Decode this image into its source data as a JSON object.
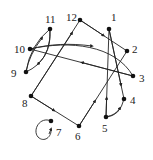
{
  "diagram": {
    "type": "directed-graph",
    "nodes": [
      {
        "id": "1",
        "label": "1",
        "x": 109,
        "y": 29,
        "lx": 112,
        "ly": 20
      },
      {
        "id": "2",
        "label": "2",
        "x": 127,
        "y": 51,
        "lx": 133,
        "ly": 51
      },
      {
        "id": "3",
        "label": "3",
        "x": 133,
        "y": 76,
        "lx": 139,
        "ly": 80
      },
      {
        "id": "4",
        "label": "4",
        "x": 124,
        "y": 99,
        "lx": 130,
        "ly": 104
      },
      {
        "id": "5",
        "label": "5",
        "x": 106,
        "y": 117,
        "lx": 102,
        "ly": 132
      },
      {
        "id": "6",
        "label": "6",
        "x": 79,
        "y": 126,
        "lx": 75,
        "ly": 140
      },
      {
        "id": "7",
        "label": "7",
        "x": 51,
        "y": 121,
        "lx": 56,
        "ly": 135
      },
      {
        "id": "8",
        "label": "8",
        "x": 31,
        "y": 96,
        "lx": 23,
        "ly": 107
      },
      {
        "id": "9",
        "label": "9",
        "x": 26,
        "y": 72,
        "lx": 12,
        "ly": 77
      },
      {
        "id": "10",
        "label": "10",
        "x": 30,
        "y": 49,
        "lx": 15,
        "ly": 53
      },
      {
        "id": "11",
        "label": "11",
        "x": 50,
        "y": 29,
        "lx": 46,
        "ly": 22
      },
      {
        "id": "12",
        "label": "12",
        "x": 80,
        "y": 20,
        "lx": 67,
        "ly": 19
      }
    ],
    "edges": [
      {
        "from": "12",
        "to": "2"
      },
      {
        "from": "1",
        "to": "4"
      },
      {
        "from": "5",
        "to": "1"
      },
      {
        "from": "5",
        "to": "4"
      },
      {
        "from": "6",
        "to": "2"
      },
      {
        "from": "8",
        "to": "12"
      },
      {
        "from": "8",
        "to": "6"
      },
      {
        "from": "10",
        "to": "3"
      },
      {
        "from": "3",
        "to": "10"
      },
      {
        "from": "9",
        "to": "11"
      },
      {
        "from": "11",
        "to": "9"
      },
      {
        "from": "7",
        "to": "7"
      }
    ]
  }
}
